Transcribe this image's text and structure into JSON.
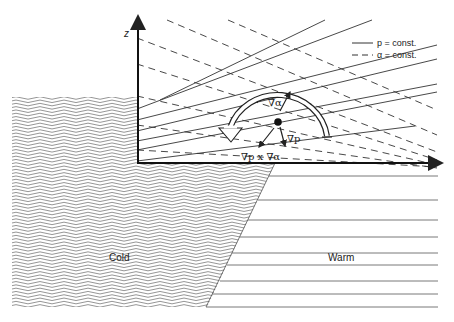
{
  "diagram": {
    "axis_label_z": "z",
    "legend": [
      {
        "style": "solid",
        "label": "p = const."
      },
      {
        "style": "dashed",
        "label": "α = const."
      }
    ],
    "vectors": {
      "grad_alpha": "∇α",
      "grad_p": "∇p",
      "cross": "∇p x ∇α"
    },
    "regions": {
      "cold": "Cold",
      "warm": "Warm"
    },
    "colors": {
      "line": "#333333",
      "hatch": "#8a8a8a",
      "background": "#ffffff"
    }
  }
}
